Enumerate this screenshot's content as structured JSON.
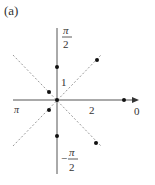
{
  "figure": {
    "panel_label": "(a)",
    "axis_labels": {
      "top_num": "π",
      "top_den": "2",
      "bottom_sign": "−",
      "bottom_num": "π",
      "bottom_den": "2",
      "left": "π",
      "right": "0",
      "radial_tick_1": "1",
      "radial_tick_2": "2"
    },
    "origin": [
      57,
      100
    ],
    "unit_px": 33,
    "dashed_lines": [
      {
        "x1": 13,
        "y1": 55,
        "x2": 101,
        "y2": 146
      },
      {
        "x1": 13,
        "y1": 146,
        "x2": 101,
        "y2": 55
      }
    ],
    "points": [
      {
        "x": 57,
        "y": 100
      },
      {
        "x": 57,
        "y": 67
      },
      {
        "x": 97,
        "y": 60
      },
      {
        "x": 49,
        "y": 92
      },
      {
        "x": 49,
        "y": 110
      },
      {
        "x": 57,
        "y": 136
      },
      {
        "x": 96,
        "y": 143
      },
      {
        "x": 124,
        "y": 100
      }
    ],
    "colors": {
      "axis": "#555555",
      "dash": "#999999",
      "point": "#111111"
    }
  }
}
